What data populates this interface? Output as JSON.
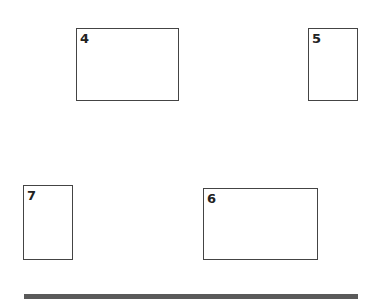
{
  "boxes": [
    {
      "label": "4",
      "x": 76,
      "y": 28,
      "w": 103,
      "h": 73
    },
    {
      "label": "5",
      "x": 308,
      "y": 28,
      "w": 50,
      "h": 73
    },
    {
      "label": "7",
      "x": 23,
      "y": 185,
      "w": 50,
      "h": 75
    },
    {
      "label": "6",
      "x": 203,
      "y": 188,
      "w": 115,
      "h": 72
    }
  ],
  "colors": {
    "border": "#444444",
    "bar": "#5a5a5a",
    "background": "#ffffff"
  }
}
